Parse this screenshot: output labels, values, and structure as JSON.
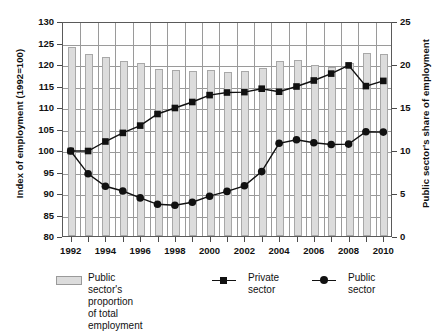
{
  "chart_data": {
    "type": "bar",
    "title": "",
    "subtitle": "",
    "xlabel": "",
    "ylabel": "Index of employment (1992=100)",
    "ylabel_right": "Public sector's share of employment",
    "ylim": [
      80,
      130
    ],
    "ylim_right": [
      0,
      25
    ],
    "yticks": [
      80,
      85,
      90,
      95,
      100,
      105,
      110,
      115,
      120,
      125,
      130
    ],
    "yticks_right": [
      0,
      5,
      10,
      15,
      20,
      25
    ],
    "grid": true,
    "legend_position": "bottom",
    "categories": [
      1992,
      1993,
      1994,
      1995,
      1996,
      1997,
      1998,
      1999,
      2000,
      2001,
      2002,
      2003,
      2004,
      2005,
      2006,
      2007,
      2008,
      2009,
      2010
    ],
    "xtick_labels": [
      "1992",
      "1994",
      "1996",
      "1998",
      "2000",
      "2002",
      "2004",
      "2006",
      "2008",
      "2010"
    ],
    "xtick_values": [
      1992,
      1994,
      1996,
      1998,
      2000,
      2002,
      2004,
      2006,
      2008,
      2010
    ],
    "series": [
      {
        "name": "Public sector's proportion of total employment",
        "type": "bar",
        "axis": "right",
        "color": "#dcdcdc",
        "edge_color": "#a8a8a8",
        "values": [
          22.0,
          21.2,
          20.8,
          20.4,
          20.1,
          19.4,
          19.3,
          19.2,
          19.3,
          19.1,
          19.2,
          19.5,
          20.4,
          20.5,
          19.9,
          19.7,
          20.1,
          21.3,
          21.2
        ]
      },
      {
        "name": "Private sector",
        "type": "line",
        "axis": "left",
        "color": "#111111",
        "marker": "square",
        "values": [
          100.0,
          100.0,
          102.2,
          104.2,
          105.9,
          108.6,
          110.0,
          111.4,
          113.0,
          113.6,
          113.7,
          114.5,
          113.8,
          115.0,
          116.4,
          118.0,
          119.9,
          115.1,
          116.3
        ]
      },
      {
        "name": "Public sector",
        "type": "line",
        "axis": "left",
        "color": "#111111",
        "marker": "circle",
        "values": [
          100.0,
          94.7,
          91.8,
          90.7,
          89.1,
          87.6,
          87.4,
          88.1,
          89.5,
          90.6,
          91.9,
          95.2,
          101.8,
          102.6,
          101.9,
          101.5,
          101.6,
          104.5,
          104.4
        ]
      }
    ]
  },
  "legend": {
    "items": [
      {
        "label": "Public sector's proportion\nof total employment",
        "glyph": "bar-swatch"
      },
      {
        "label": "Private\nsector",
        "glyph": "line-square"
      },
      {
        "label": "Public\nsector",
        "glyph": "line-circle"
      }
    ]
  }
}
